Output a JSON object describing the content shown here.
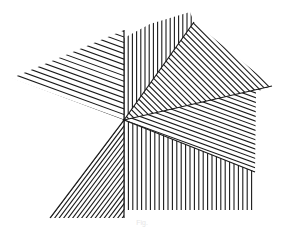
{
  "figure": {
    "type": "hatched-sector line diagram",
    "background": "#ffffff",
    "stroke_color": "#1a1a1a",
    "stroke_width": 1.1,
    "center": [
      124,
      120
    ],
    "regions": [
      {
        "name": "upper-left-shallow-hatch",
        "polygon": [
          [
            124,
            120
          ],
          [
            124,
            30
          ],
          [
            12,
            78
          ]
        ],
        "angle_deg": 160,
        "spacing": 5.2
      },
      {
        "name": "top-vertical-hatch",
        "polygon": [
          [
            124,
            120
          ],
          [
            124,
            38
          ],
          [
            150,
            24
          ],
          [
            190,
            12
          ],
          [
            194,
            22
          ]
        ],
        "angle_deg": 90,
        "spacing": 4.2
      },
      {
        "name": "upper-right-diagonal-hatch",
        "polygon": [
          [
            124,
            120
          ],
          [
            194,
            22
          ],
          [
            272,
            86
          ]
        ],
        "angle_deg": 135,
        "spacing": 4.2
      },
      {
        "name": "right-shallow-hatch",
        "polygon": [
          [
            124,
            120
          ],
          [
            272,
            86
          ],
          [
            256,
            92
          ],
          [
            255,
            172
          ]
        ],
        "angle_deg": 160,
        "spacing": 4.4
      },
      {
        "name": "bottom-right-vertical-hatch",
        "polygon": [
          [
            124,
            120
          ],
          [
            255,
            172
          ],
          [
            255,
            210
          ],
          [
            124,
            210
          ]
        ],
        "angle_deg": 90,
        "spacing": 4.4
      },
      {
        "name": "bottom-left-diagonal-hatch",
        "polygon": [
          [
            124,
            120
          ],
          [
            124,
            218
          ],
          [
            50,
            218
          ]
        ],
        "angle_deg": 53,
        "spacing": 3.6
      }
    ],
    "boundary_lines": [
      [
        [
          124,
          30
        ],
        [
          124,
          218
        ]
      ],
      [
        [
          124,
          120
        ],
        [
          194,
          22
        ]
      ],
      [
        [
          124,
          120
        ],
        [
          272,
          86
        ]
      ],
      [
        [
          124,
          120
        ],
        [
          50,
          218
        ]
      ],
      [
        [
          124,
          120
        ],
        [
          255,
          172
        ]
      ]
    ]
  },
  "caption": {
    "text": "Fig."
  }
}
